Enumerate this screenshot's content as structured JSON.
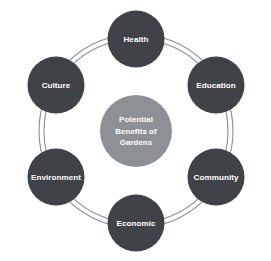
{
  "diagram": {
    "type": "cycle-ring",
    "title": "Potential Benefits of Gardens",
    "background_color": "#ffffff",
    "center": {
      "label_lines": [
        "Potential",
        "Benefits of",
        "Gardens"
      ],
      "line1": "Potential",
      "line2": "Benefits of",
      "line3": "Gardens",
      "fill_color": "#8d9195",
      "text_color": "#ffffff",
      "cx": 136,
      "cy": 131,
      "r": 36
    },
    "ring": {
      "stroke_color": "#8a8d90",
      "inner_radius": 92,
      "outer_radius": 97,
      "stroke_width": 1.1,
      "style": "double-line"
    },
    "nodes": [
      {
        "label": "Health",
        "angle_deg": 270,
        "cx": 136,
        "cy": 39,
        "r": 28.5,
        "fill_color": "#3f4347",
        "text_color": "#ffffff"
      },
      {
        "label": "Education",
        "angle_deg": 330,
        "cx": 216,
        "cy": 85,
        "r": 28.5,
        "fill_color": "#3f4347",
        "text_color": "#ffffff"
      },
      {
        "label": "Community",
        "angle_deg": 30,
        "cx": 216,
        "cy": 177,
        "r": 28.5,
        "fill_color": "#3f4347",
        "text_color": "#ffffff"
      },
      {
        "label": "Economic",
        "angle_deg": 90,
        "cx": 136,
        "cy": 223,
        "r": 28.5,
        "fill_color": "#3f4347",
        "text_color": "#ffffff"
      },
      {
        "label": "Environment",
        "angle_deg": 150,
        "cx": 56,
        "cy": 177,
        "r": 28.5,
        "fill_color": "#3f4347",
        "text_color": "#ffffff"
      },
      {
        "label": "Culture",
        "angle_deg": 210,
        "cx": 56,
        "cy": 85,
        "r": 28.5,
        "fill_color": "#3f4347",
        "text_color": "#ffffff"
      }
    ]
  }
}
